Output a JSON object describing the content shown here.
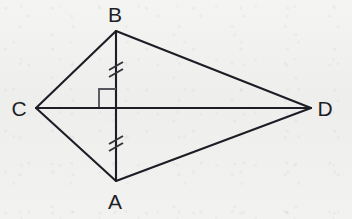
{
  "figure": {
    "kind": "geometry-diagram",
    "shape_name": "kite",
    "background_color": "#f0f0ee",
    "stroke_color": "#1d1d26",
    "label_color": "#1e1e26",
    "marker_color": "#55555e",
    "width": 352,
    "height": 219
  },
  "vertices": {
    "B": {
      "label": "B",
      "x": 116,
      "y": 31,
      "label_x": 115,
      "label_y": 22
    },
    "A": {
      "label": "A",
      "x": 116,
      "y": 181,
      "label_x": 115,
      "label_y": 209
    },
    "C": {
      "label": "C",
      "x": 36,
      "y": 108,
      "label_x": 19,
      "label_y": 116
    },
    "D": {
      "label": "D",
      "x": 311,
      "y": 108,
      "label_x": 325,
      "label_y": 116
    },
    "E": {
      "label": "",
      "x": 116,
      "y": 108,
      "label_x": 116,
      "label_y": 108
    }
  },
  "segments": [
    {
      "name": "CB",
      "from": "C",
      "to": "B",
      "x1": 36,
      "y1": 108,
      "x2": 116,
      "y2": 31
    },
    {
      "name": "BD",
      "from": "B",
      "to": "D",
      "x1": 116,
      "y1": 31,
      "x2": 311,
      "y2": 108
    },
    {
      "name": "DA",
      "from": "D",
      "to": "A",
      "x1": 311,
      "y1": 108,
      "x2": 116,
      "y2": 181
    },
    {
      "name": "AC",
      "from": "A",
      "to": "C",
      "x1": 116,
      "y1": 181,
      "x2": 36,
      "y2": 108
    },
    {
      "name": "CD",
      "from": "C",
      "to": "D",
      "x1": 36,
      "y1": 108,
      "x2": 311,
      "y2": 108
    },
    {
      "name": "BA",
      "from": "B",
      "to": "A",
      "x1": 116,
      "y1": 31,
      "x2": 116,
      "y2": 181
    }
  ],
  "markings": {
    "congruence_ticks": [
      {
        "name": "tick-mark-BE",
        "on_segment": "BE",
        "count": 2,
        "tick1": {
          "x1": 109,
          "y1": 70,
          "x2": 123,
          "y2": 62
        },
        "tick2": {
          "x1": 109,
          "y1": 77,
          "x2": 123,
          "y2": 69
        }
      },
      {
        "name": "tick-mark-AE",
        "on_segment": "EA",
        "count": 2,
        "tick1": {
          "x1": 109,
          "y1": 144,
          "x2": 123,
          "y2": 136
        },
        "tick2": {
          "x1": 109,
          "y1": 151,
          "x2": 123,
          "y2": 143
        }
      }
    ],
    "right_angle": {
      "name": "right-angle-marker",
      "at_vertex": "E",
      "quadrant": "upper-left",
      "points": "99,107 99,89 116,89",
      "size": 18
    }
  }
}
